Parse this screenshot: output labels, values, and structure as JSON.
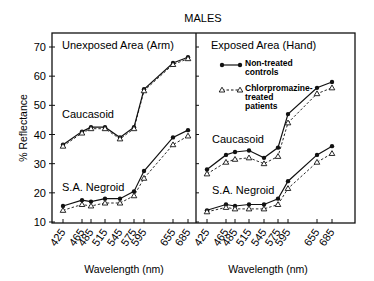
{
  "chart_data": {
    "type": "line",
    "title": "MALES",
    "ylabel": "% Reflectance",
    "xlabel": "Wavelength (nm)",
    "ylim": [
      10,
      70
    ],
    "yticks": [
      10,
      20,
      30,
      40,
      50,
      60,
      70
    ],
    "x": [
      425,
      465,
      485,
      515,
      545,
      575,
      595,
      655,
      685
    ],
    "x_tick_labels": [
      "425",
      "465",
      "485",
      "515",
      "545",
      "575",
      "595",
      "655",
      "685"
    ],
    "legend": {
      "position": "upper-left of right panel",
      "entries": [
        {
          "name": "Non-treated controls",
          "lines": [
            "Non-treated",
            "controls"
          ],
          "marker": "filled-circle",
          "line_style": "solid"
        },
        {
          "name": "Chlorpromazine-treated patients",
          "lines": [
            "Chlorpromazine-",
            "treated",
            "patients"
          ],
          "marker": "open-triangle",
          "line_style": "dashed"
        }
      ]
    },
    "panels": [
      {
        "title": "Unexposed Area (Arm)",
        "groups": [
          {
            "label": "Caucasoid",
            "series": [
              {
                "name": "Non-treated controls",
                "values": [
                  36.5,
                  41,
                  42.5,
                  42.5,
                  39,
                  42.5,
                  55.5,
                  64.5,
                  66.5
                ]
              },
              {
                "name": "Chlorpromazine-treated patients",
                "values": [
                  36,
                  40.5,
                  42,
                  42,
                  38.5,
                  42,
                  55,
                  64,
                  66
                ]
              }
            ]
          },
          {
            "label": "S.A. Negroid",
            "series": [
              {
                "name": "Non-treated controls",
                "values": [
                  15.5,
                  17.5,
                  17,
                  18,
                  18,
                  20.5,
                  27.5,
                  39,
                  41.5
                ]
              },
              {
                "name": "Chlorpromazine-treated patients",
                "values": [
                  14,
                  16,
                  15.5,
                  16.5,
                  16.5,
                  19,
                  25,
                  36.5,
                  39.5
                ]
              }
            ]
          }
        ]
      },
      {
        "title": "Exposed Area (Hand)",
        "groups": [
          {
            "label": "Caucasoid",
            "series": [
              {
                "name": "Non-treated controls",
                "values": [
                  28,
                  33,
                  34,
                  34.5,
                  32,
                  35.5,
                  47,
                  56,
                  58
                ]
              },
              {
                "name": "Chlorpromazine-treated patients",
                "values": [
                  26.5,
                  30.5,
                  31.5,
                  32,
                  30,
                  32.5,
                  44,
                  54,
                  56
                ]
              }
            ]
          },
          {
            "label": "S.A. Negroid",
            "series": [
              {
                "name": "Non-treated controls",
                "values": [
                  14,
                  16,
                  15.5,
                  16,
                  16,
                  18,
                  24,
                  33,
                  36
                ]
              },
              {
                "name": "Chlorpromazine-treated patients",
                "values": [
                  13.5,
                  15,
                  14.5,
                  14.5,
                  14.5,
                  16,
                  21.5,
                  30.5,
                  33.5
                ]
              }
            ]
          }
        ]
      }
    ],
    "grid": false
  }
}
